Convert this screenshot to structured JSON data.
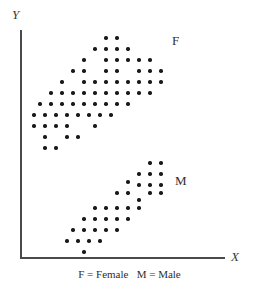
{
  "axes": {
    "y_label": "Y",
    "x_label": "X"
  },
  "labels": {
    "female": "F",
    "male": "M"
  },
  "caption": "F = Female   M = Male",
  "colors": {
    "dot": "#1a1a1a",
    "axis": "#4a4a4a",
    "text": "#2e2e2e",
    "background": "#ffffff"
  },
  "chart_data": {
    "type": "scatter",
    "title": "",
    "xlabel": "X",
    "ylabel": "Y",
    "grid": false,
    "legend_position": "in-plot",
    "axis_ranges": {
      "x": [
        20,
        225
      ],
      "y": [
        30,
        257
      ]
    },
    "annotations": [
      {
        "text": "F",
        "x": 172,
        "y": 34
      },
      {
        "text": "M",
        "x": 175,
        "y": 174
      }
    ],
    "note": "Two positively-sloped elliptical point clouds; Female cluster upper-left-to-upper-right, Male cluster lower, shifted right and down. Coordinates are pixel positions of each plotted dot.",
    "series": [
      {
        "name": "F = Female",
        "marker": "filled-circle",
        "count": 62,
        "points": [
          [
            106,
            38
          ],
          [
            117,
            38
          ],
          [
            95,
            49
          ],
          [
            106,
            49
          ],
          [
            117,
            49
          ],
          [
            128,
            49
          ],
          [
            84,
            60
          ],
          [
            106,
            60
          ],
          [
            117,
            60
          ],
          [
            128,
            60
          ],
          [
            139,
            60
          ],
          [
            150,
            60
          ],
          [
            73,
            71
          ],
          [
            84,
            71
          ],
          [
            106,
            71
          ],
          [
            117,
            71
          ],
          [
            139,
            71
          ],
          [
            150,
            71
          ],
          [
            161,
            71
          ],
          [
            62,
            82
          ],
          [
            84,
            82
          ],
          [
            95,
            82
          ],
          [
            106,
            82
          ],
          [
            117,
            82
          ],
          [
            128,
            82
          ],
          [
            139,
            82
          ],
          [
            150,
            82
          ],
          [
            161,
            82
          ],
          [
            51,
            93
          ],
          [
            62,
            93
          ],
          [
            73,
            93
          ],
          [
            84,
            93
          ],
          [
            95,
            93
          ],
          [
            106,
            93
          ],
          [
            117,
            93
          ],
          [
            128,
            93
          ],
          [
            139,
            93
          ],
          [
            150,
            93
          ],
          [
            40,
            104
          ],
          [
            51,
            104
          ],
          [
            62,
            104
          ],
          [
            73,
            104
          ],
          [
            84,
            104
          ],
          [
            95,
            104
          ],
          [
            106,
            104
          ],
          [
            117,
            104
          ],
          [
            128,
            104
          ],
          [
            34,
            115
          ],
          [
            45,
            115
          ],
          [
            56,
            115
          ],
          [
            67,
            115
          ],
          [
            78,
            115
          ],
          [
            89,
            115
          ],
          [
            100,
            115
          ],
          [
            111,
            115
          ],
          [
            34,
            126
          ],
          [
            45,
            126
          ],
          [
            56,
            126
          ],
          [
            67,
            126
          ],
          [
            95,
            126
          ],
          [
            45,
            137
          ],
          [
            67,
            137
          ],
          [
            78,
            137
          ],
          [
            45,
            148
          ],
          [
            56,
            148
          ]
        ]
      },
      {
        "name": "M = Male",
        "marker": "filled-circle",
        "count": 37,
        "points": [
          [
            150,
            163
          ],
          [
            161,
            163
          ],
          [
            139,
            174
          ],
          [
            150,
            174
          ],
          [
            161,
            174
          ],
          [
            128,
            182
          ],
          [
            139,
            185
          ],
          [
            150,
            185
          ],
          [
            161,
            185
          ],
          [
            117,
            193
          ],
          [
            128,
            193
          ],
          [
            150,
            193
          ],
          [
            161,
            193
          ],
          [
            139,
            200
          ],
          [
            95,
            208
          ],
          [
            106,
            208
          ],
          [
            117,
            208
          ],
          [
            128,
            208
          ],
          [
            139,
            208
          ],
          [
            84,
            219
          ],
          [
            95,
            219
          ],
          [
            106,
            219
          ],
          [
            117,
            219
          ],
          [
            128,
            219
          ],
          [
            73,
            230
          ],
          [
            84,
            230
          ],
          [
            95,
            230
          ],
          [
            106,
            230
          ],
          [
            117,
            230
          ],
          [
            67,
            241
          ],
          [
            78,
            241
          ],
          [
            89,
            241
          ],
          [
            100,
            241
          ],
          [
            84,
            252
          ]
        ]
      }
    ]
  }
}
